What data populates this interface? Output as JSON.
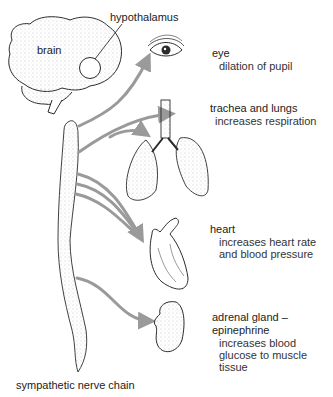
{
  "diagram": {
    "source_labels": {
      "brain": "brain",
      "hypothalamus": "hypothalamus",
      "nerve_chain": "sympathetic nerve chain"
    },
    "targets": [
      {
        "organ": "eye",
        "effect_lines": [
          "dilation of pupil"
        ]
      },
      {
        "organ": "trachea and lungs",
        "effect_lines": [
          "increases respiration"
        ]
      },
      {
        "organ": "heart",
        "effect_lines": [
          "increases heart rate",
          "and blood pressure"
        ]
      },
      {
        "organ_lines": [
          "adrenal gland –",
          "epinephrine"
        ],
        "effect_lines": [
          "increases blood",
          "glucose to muscle",
          "tissue"
        ]
      }
    ],
    "colors": {
      "arrow": "#9a9a9a",
      "outline": "#2b2b2b",
      "stipple": "#8a8a8a",
      "background": "#ffffff"
    }
  }
}
